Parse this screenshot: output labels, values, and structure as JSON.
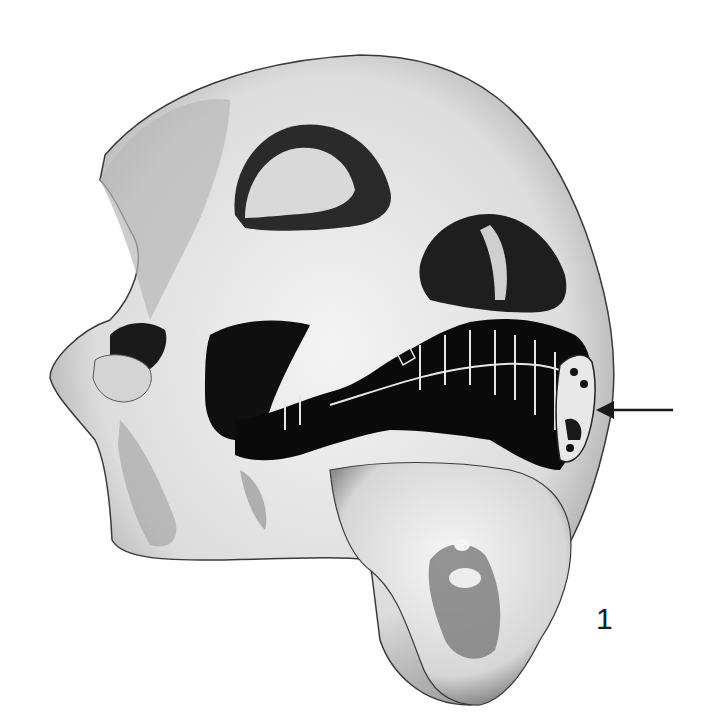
{
  "figure": {
    "number_label": "1",
    "annotation": "arrow-pointing-left-at-appliance"
  },
  "colors": {
    "background": "#ffffff",
    "bone_light": "#ececec",
    "bone_mid": "#c9c9c9",
    "bone_shadow": "#6e6e6e",
    "dark": "#111111"
  }
}
